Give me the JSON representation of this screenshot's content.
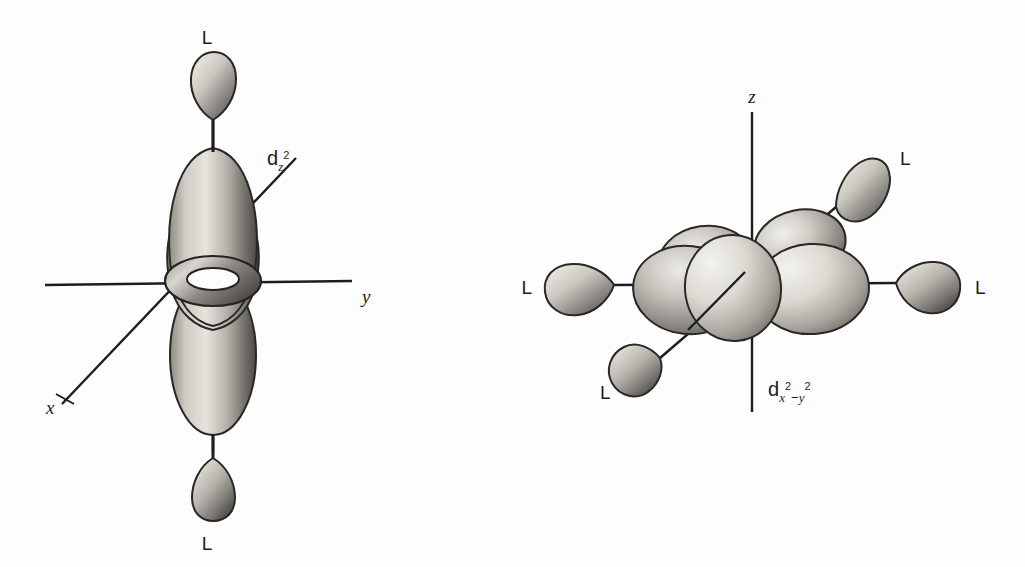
{
  "figure": {
    "background_color": "#fdfdfd",
    "ink_color": "#1d1d1d",
    "style": "hand-drawn pencil shaded chemistry illustration"
  },
  "panels": [
    {
      "id": "left",
      "orbital_label": {
        "base": "d",
        "sub": "z",
        "sup": "2",
        "full": "dz2"
      },
      "axes": [
        {
          "name": "y",
          "label": "y",
          "orientation": "horizontal"
        },
        {
          "name": "x",
          "label": "x",
          "orientation": "diagonal-lower-left"
        },
        {
          "name": "z",
          "label": "",
          "orientation": "vertical"
        }
      ],
      "ligands": [
        {
          "label": "L",
          "position": "top"
        },
        {
          "label": "L",
          "position": "bottom"
        }
      ],
      "lobes": 2,
      "torus": true
    },
    {
      "id": "right",
      "orbital_label": {
        "base": "d",
        "sub_a": "x",
        "sup_a": "2",
        "minus": "−",
        "sub_b": "y",
        "sup_b": "2",
        "full": "dx2-y2"
      },
      "axes": [
        {
          "name": "z",
          "label": "z",
          "orientation": "vertical"
        },
        {
          "name": "y",
          "label": "",
          "orientation": "horizontal"
        },
        {
          "name": "x",
          "label": "",
          "orientation": "diagonal"
        }
      ],
      "ligands": [
        {
          "label": "L",
          "position": "left"
        },
        {
          "label": "L",
          "position": "right"
        },
        {
          "label": "L",
          "position": "upper-right"
        },
        {
          "label": "L",
          "position": "lower-left"
        }
      ],
      "lobes": 4,
      "torus": false
    }
  ]
}
